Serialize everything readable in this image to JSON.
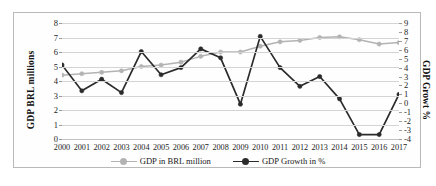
{
  "chart_data": {
    "type": "line",
    "title": "",
    "xlabel": "",
    "ylabel": "GDP BRL millions",
    "y2label": "GDP Growt %",
    "grid": true,
    "legend_position": "bottom",
    "categories": [
      "2000",
      "2001",
      "2002",
      "2003",
      "2004",
      "2005",
      "2006",
      "2007",
      "2008",
      "2009",
      "2010",
      "2011",
      "2012",
      "2013",
      "2014",
      "2015",
      "2016",
      "2017"
    ],
    "ylim": [
      0,
      8
    ],
    "yticks": [
      0,
      1,
      2,
      3,
      4,
      5,
      6,
      7,
      8
    ],
    "y2lim": [
      -4,
      9
    ],
    "y2ticks": [
      9,
      8,
      7,
      6,
      5,
      4,
      3,
      2,
      1,
      0,
      -1,
      -2,
      -3,
      -4
    ],
    "series": [
      {
        "name": "GDP in BRL million",
        "axis": "left",
        "color": "#b3b3b3",
        "marker": "circle",
        "values": [
          4.4,
          4.5,
          4.6,
          4.7,
          5.0,
          5.1,
          5.3,
          5.7,
          6.0,
          6.0,
          6.4,
          6.7,
          6.8,
          7.0,
          7.05,
          6.85,
          6.55,
          6.65
        ]
      },
      {
        "name": "GDP Growth in %",
        "axis": "right",
        "color": "#2b2b2b",
        "marker": "circle",
        "values": [
          4.3,
          1.4,
          2.7,
          1.2,
          5.8,
          3.2,
          4.0,
          6.1,
          5.1,
          -0.1,
          7.5,
          4.0,
          1.9,
          3.0,
          0.5,
          -3.5,
          -3.5,
          1.0
        ]
      }
    ]
  },
  "legend": {
    "items": [
      {
        "label": "GDP in BRL million",
        "color": "#b3b3b3"
      },
      {
        "label": "GDP Growth in %",
        "color": "#2b2b2b"
      }
    ]
  }
}
